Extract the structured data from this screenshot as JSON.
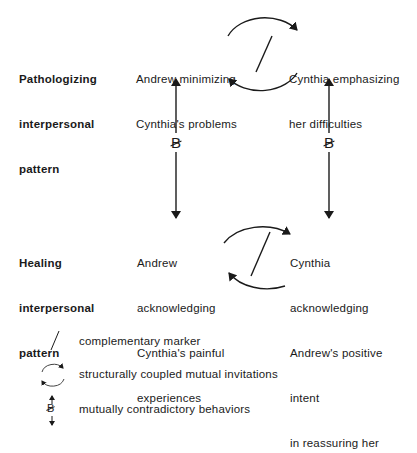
{
  "rows": {
    "pathologizing": {
      "label": [
        "Pathologizing",
        "interpersonal",
        "pattern"
      ],
      "left": [
        "Andrew minimizing",
        "Cynthia's problems"
      ],
      "right": [
        "Cynthia emphasizing",
        "her difficulties"
      ]
    },
    "healing": {
      "label": [
        "Healing",
        "interpersonal",
        "pattern"
      ],
      "left": [
        "Andrew",
        "acknowledging",
        "Cynthia's painful",
        "experiences"
      ],
      "right": [
        "Cynthia",
        "acknowledging",
        "Andrew's positive",
        "intent",
        "in reassuring her"
      ]
    }
  },
  "contradiction_symbol": "B",
  "legend": [
    {
      "icon": "complementary-marker-icon",
      "label": "complementary marker"
    },
    {
      "icon": "circular-arrows-icon",
      "label": "structurally coupled mutual invitations"
    },
    {
      "icon": "contradiction-b-icon",
      "label": "mutually contradictory behaviors"
    }
  ]
}
